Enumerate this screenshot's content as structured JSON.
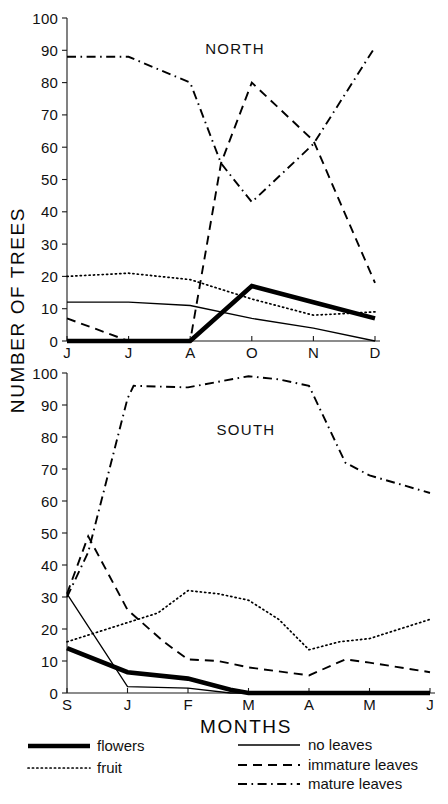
{
  "figure": {
    "y_axis_title": "NUMBER OF TREES",
    "x_axis_title": "MONTHS"
  },
  "legend": {
    "items": [
      {
        "label": "flowers",
        "style": "solid-thick",
        "color": "#000000"
      },
      {
        "label": "fruit",
        "style": "dotted",
        "color": "#000000"
      },
      {
        "label": "no leaves",
        "style": "solid-thin",
        "color": "#000000"
      },
      {
        "label": "immature leaves",
        "style": "dashed",
        "color": "#000000"
      },
      {
        "label": "mature leaves",
        "style": "dash-dot",
        "color": "#000000"
      }
    ]
  },
  "chart_data": [
    {
      "type": "line",
      "title": "NORTH",
      "xlabel": "MONTHS",
      "ylabel": "NUMBER OF TREES",
      "ylim": [
        0,
        100
      ],
      "ytick_labels": [
        "0",
        "10",
        "20",
        "30",
        "40",
        "50",
        "60",
        "70",
        "80",
        "90",
        "100"
      ],
      "yticks": [
        0,
        10,
        20,
        30,
        40,
        50,
        60,
        70,
        80,
        90,
        100
      ],
      "categories": [
        "J",
        "J",
        "A",
        "O",
        "N",
        "D"
      ],
      "xtick_labels": [
        "J",
        "J",
        "A",
        "O",
        "N",
        "D"
      ],
      "x": [
        0,
        1,
        2,
        3,
        4,
        5
      ],
      "grid": false,
      "legend_position": "below-figure",
      "series": [
        {
          "name": "flowers",
          "style": "solid-thick",
          "x": [
            0,
            1,
            2,
            3,
            4,
            5
          ],
          "values": [
            0,
            0,
            0,
            17,
            12,
            7
          ]
        },
        {
          "name": "fruit",
          "style": "dotted",
          "x": [
            0,
            1,
            2,
            3,
            4,
            5
          ],
          "values": [
            20,
            21,
            19,
            13,
            8,
            9
          ]
        },
        {
          "name": "no leaves",
          "style": "solid-thin",
          "x": [
            0,
            1,
            2,
            3,
            4,
            5
          ],
          "values": [
            12,
            12,
            11,
            7,
            4,
            0
          ]
        },
        {
          "name": "immature leaves",
          "style": "dashed",
          "x": [
            0,
            1,
            2,
            2.5,
            3,
            4,
            5
          ],
          "values": [
            7,
            0,
            0,
            55,
            80,
            62,
            18
          ]
        },
        {
          "name": "mature leaves",
          "style": "dash-dot",
          "x": [
            0,
            1,
            2,
            2.5,
            3,
            4,
            5
          ],
          "values": [
            88,
            88,
            80,
            55,
            43,
            61,
            91
          ]
        }
      ]
    },
    {
      "type": "line",
      "title": "SOUTH",
      "xlabel": "MONTHS",
      "ylabel": "NUMBER OF TREES",
      "ylim": [
        0,
        100
      ],
      "ytick_labels": [
        "0",
        "10",
        "20",
        "30",
        "40",
        "50",
        "60",
        "70",
        "80",
        "90",
        "100"
      ],
      "yticks": [
        0,
        10,
        20,
        30,
        40,
        50,
        60,
        70,
        80,
        90,
        100
      ],
      "categories": [
        "S",
        "J",
        "F",
        "M",
        "A",
        "M",
        "J"
      ],
      "xtick_labels": [
        "S",
        "J",
        "F",
        "M",
        "A",
        "M",
        "J"
      ],
      "x": [
        0,
        1,
        2,
        3,
        4,
        5,
        6
      ],
      "grid": false,
      "legend_position": "below-figure",
      "series": [
        {
          "name": "flowers",
          "style": "solid-thick",
          "x": [
            0,
            1,
            2,
            2.7,
            3,
            4,
            5,
            6
          ],
          "values": [
            14,
            6.5,
            4.5,
            1,
            0,
            0,
            0,
            0
          ]
        },
        {
          "name": "fruit",
          "style": "dotted",
          "x": [
            0,
            1,
            1.5,
            2,
            2.5,
            3,
            3.5,
            4,
            4.5,
            5,
            6
          ],
          "values": [
            16,
            22,
            25,
            32,
            31,
            29,
            23,
            13.5,
            16,
            17,
            23
          ]
        },
        {
          "name": "no leaves",
          "style": "solid-thin",
          "x": [
            0,
            1,
            2,
            2.7,
            3,
            4,
            5,
            6
          ],
          "values": [
            31,
            2,
            1.5,
            0,
            0,
            0,
            0,
            0
          ]
        },
        {
          "name": "immature leaves",
          "style": "dashed",
          "x": [
            0,
            0.35,
            1,
            1.6,
            2,
            2.5,
            3,
            4,
            4.6,
            5,
            6
          ],
          "values": [
            31,
            49,
            26,
            16,
            10.5,
            10,
            8,
            5.5,
            10.5,
            9.5,
            6.5
          ]
        },
        {
          "name": "mature leaves",
          "style": "dash-dot",
          "x": [
            0,
            0.35,
            1,
            1.1,
            2,
            3,
            3.5,
            4,
            4.6,
            5,
            6
          ],
          "values": [
            30,
            44,
            92,
            96,
            95.5,
            99,
            98,
            96,
            72,
            68,
            62.5
          ]
        }
      ]
    }
  ]
}
